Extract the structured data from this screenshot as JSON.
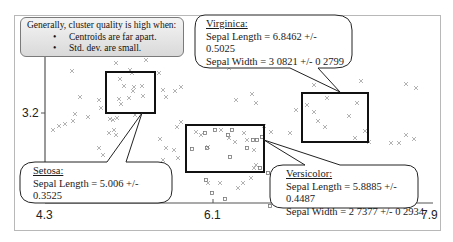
{
  "info_box": {
    "heading": "Generally, cluster quality is high when:",
    "bullets": [
      "Centroids are far apart.",
      "Std. dev. are small."
    ],
    "bullet_glyph": "•"
  },
  "callouts": {
    "virginica": {
      "title": "Virginica:",
      "line1": "Sepal Length = 6.8462 +/-",
      "line2": "0.5025",
      "line3": "Sepal Width = 3 0821 +/- 0 2799"
    },
    "setosa": {
      "title": "Setosa:",
      "line1": "Sepal Length = 5.006 +/-",
      "line2": "0.3525"
    },
    "versicolor": {
      "title": "Versicolor:",
      "line1": "Sepal Length = 5.8885 +/-",
      "line2": "0.4487",
      "line3": "Sepal Width = 2 7377 +/- 0 2934"
    }
  },
  "axes": {
    "y_tick": "3.2",
    "x_ticks": [
      "4.3",
      "6.1",
      "7.9"
    ]
  },
  "colors": {
    "point": "#9a9a9a",
    "box": "#111111",
    "frame": "#b8b8b8"
  },
  "chart_data": {
    "type": "scatter",
    "title": "",
    "xlabel": "Sepal Length",
    "ylabel": "Sepal Width",
    "x_ticks": [
      4.3,
      6.1,
      7.9
    ],
    "y_ticks": [
      3.2
    ],
    "xlim": [
      4.3,
      7.9
    ],
    "grid": false,
    "legend": "none",
    "series": [
      {
        "name": "Setosa",
        "marker": "x",
        "centroid": {
          "sepal_length": 5.006,
          "sepal_length_sd": 0.3525
        }
      },
      {
        "name": "Versicolor",
        "marker": "square",
        "centroid": {
          "sepal_length": 5.8885,
          "sepal_length_sd": 0.4487,
          "sepal_width": 2.7377,
          "sepal_width_sd": 0.2934
        }
      },
      {
        "name": "Virginica",
        "marker": "x",
        "centroid": {
          "sepal_length": 6.8462,
          "sepal_length_sd": 0.5025,
          "sepal_width": 3.0821,
          "sepal_width_sd": 0.2799
        }
      }
    ],
    "annotations": [
      "Generally, cluster quality is high when: Centroids are far apart. Std. dev. are small.",
      "Setosa: Sepal Length = 5.006 +/- 0.3525",
      "Versicolor: Sepal Length = 5.8885 +/- 0.4487, Sepal Width = 2.7377 +/- 0.2934",
      "Virginica: Sepal Length = 6.8462 +/- 0.5025, Sepal Width = 3.0821 +/- 0.2799"
    ]
  }
}
